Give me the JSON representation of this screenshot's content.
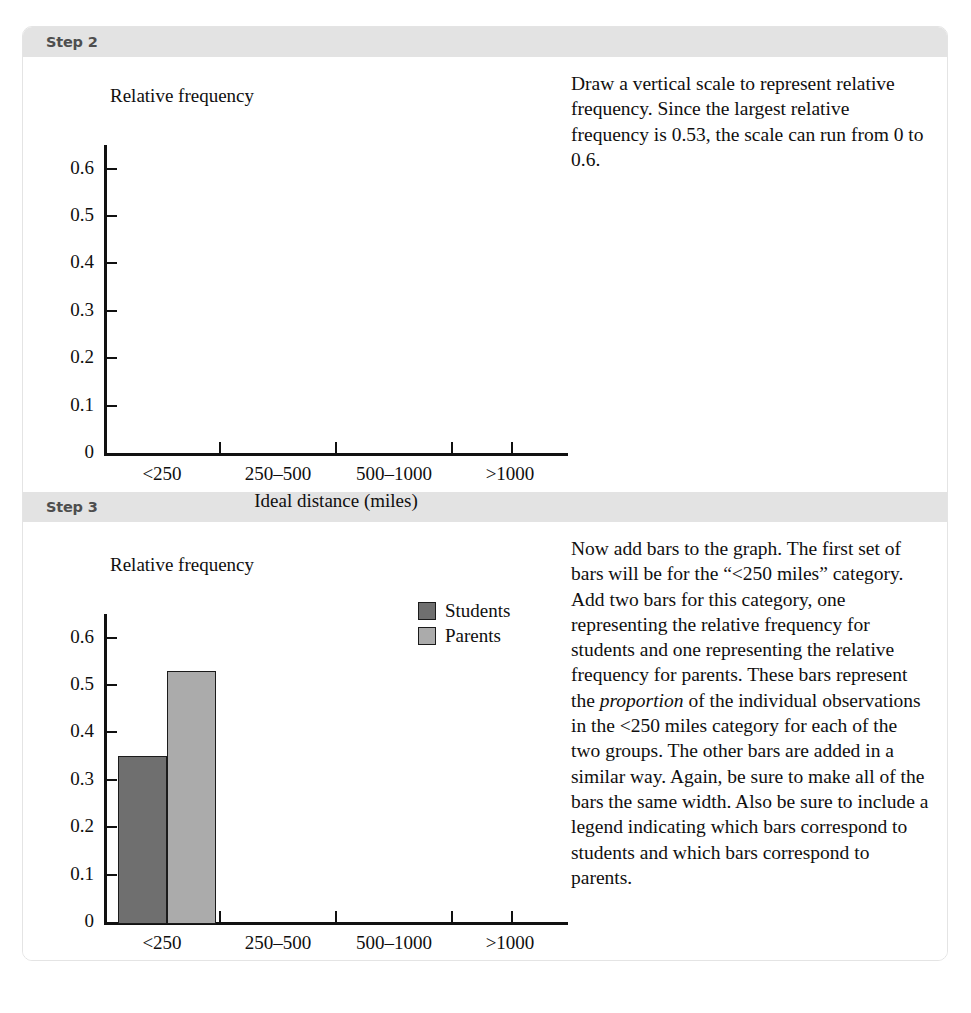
{
  "sections": [
    {
      "band_label": "Step 2",
      "paragraph": "Draw a vertical scale to represent relative frequency. Since the largest relative frequency is 0.53, the scale can run from 0 to 0.6.",
      "chart_key": "step2"
    },
    {
      "band_label": "Step 3",
      "paragraph_a": "Now add bars to the graph. The first set of bars will be for the “<250 miles” category. Add two bars for this category, one representing the relative frequency for students and one representing the relative frequency for parents. These bars represent the ",
      "paragraph_em": "proportion",
      "paragraph_b": " of the individual observations in the <250 miles category for each of the two groups. The other bars are added in a similar way. Again, be sure to make all of the bars the same width. Also be sure to include a legend indicating which bars correspond to students and which bars correspond to parents.",
      "chart_key": "step3"
    }
  ],
  "chart_data": [
    {
      "id": "step2",
      "type": "bar",
      "title": "Relative frequency",
      "ylabel": "Relative frequency",
      "xlabel": "Ideal distance (miles)",
      "categories": [
        "<250",
        "250–500",
        "500–1000",
        ">1000"
      ],
      "ytick_labels": [
        "0.6",
        "0.5",
        "0.4",
        "0.3",
        "0.2",
        "0.1",
        "0"
      ],
      "ytick_values": [
        0.6,
        0.5,
        0.4,
        0.3,
        0.2,
        0.1,
        0
      ],
      "ylim": [
        0,
        0.65
      ],
      "grid": false,
      "legend": [],
      "series": []
    },
    {
      "id": "step3",
      "type": "bar",
      "title": "Relative frequency",
      "ylabel": "Relative frequency",
      "xlabel": "Ideal distance (miles)",
      "categories": [
        "<250",
        "250–500",
        "500–1000",
        ">1000"
      ],
      "ytick_labels": [
        "0.6",
        "0.5",
        "0.4",
        "0.3",
        "0.2",
        "0.1",
        "0"
      ],
      "ytick_values": [
        0.6,
        0.5,
        0.4,
        0.3,
        0.2,
        0.1,
        0
      ],
      "ylim": [
        0,
        0.65
      ],
      "grid": false,
      "legend_position": "upper-right",
      "series": [
        {
          "name": "Students",
          "color": "#6f6f6f",
          "values": [
            0.35,
            null,
            null,
            null
          ]
        },
        {
          "name": "Parents",
          "color": "#ababab",
          "values": [
            0.53,
            null,
            null,
            null
          ]
        }
      ]
    }
  ],
  "colors": {
    "band_background": "#e3e3e3",
    "band_text": "#4e4e4e",
    "axis": "#111111",
    "students": "#6f6f6f",
    "parents": "#ababab",
    "page_border": "#e4e4e4",
    "body_text": "#100f0f"
  }
}
